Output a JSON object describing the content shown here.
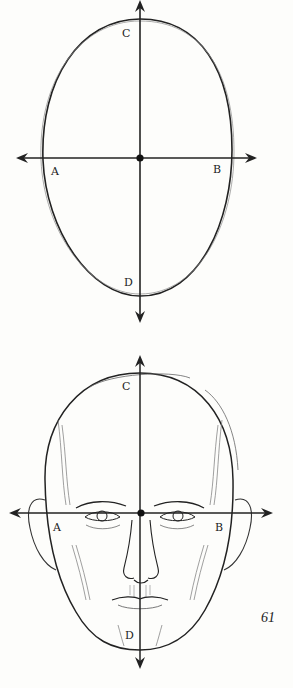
{
  "page": {
    "page_number": "61"
  },
  "figures": [
    {
      "id": "oval-diagram",
      "description": "Egg-shaped oval bisected by perpendicular axes with center point",
      "labels": {
        "top": "C",
        "left": "A",
        "right": "B",
        "bottom": "D"
      }
    },
    {
      "id": "head-diagram",
      "description": "Front view of a bald male head drawn over the same oval with axes through the eye line",
      "labels": {
        "top": "C",
        "left": "A",
        "right": "B",
        "bottom": "D"
      }
    }
  ],
  "colors": {
    "ink": "#222222",
    "paper": "#fdfdfb"
  }
}
